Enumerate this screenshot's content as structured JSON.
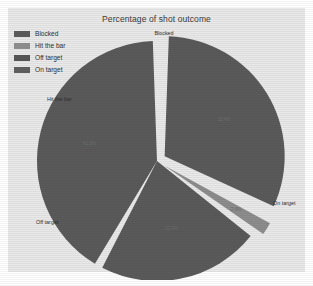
{
  "chart_data": {
    "type": "pie",
    "title": "Percentage of shot outcome",
    "categories": [
      "Blocked",
      "Hit the bar",
      "Off target",
      "On target"
    ],
    "values": [
      32.4,
      2.8,
      22.9,
      41.9
    ],
    "value_labels": [
      "32.4%",
      "2.8%",
      "22.9%",
      "41.9%"
    ],
    "unit": "%",
    "legend_position": "top-left",
    "exploded": [
      "Blocked",
      "Hit the bar"
    ],
    "colors": [
      "#5a5a5a",
      "#8d8d8d",
      "#5a5a5a",
      "#5a5a5a"
    ],
    "grid": false,
    "xlabel": "",
    "ylabel": "",
    "outer_labels": {
      "blocked": "Blocked",
      "hit_the_bar": "Hit the bar",
      "off_target": "Off target",
      "on_target": "On target"
    }
  },
  "legend": {
    "items": [
      {
        "label": "Blocked",
        "color": "#5c5c5c"
      },
      {
        "label": "Hit the bar",
        "color": "#8f8f8f"
      },
      {
        "label": "Off target",
        "color": "#555555"
      },
      {
        "label": "On target",
        "color": "#606060"
      }
    ]
  },
  "palette": {
    "page_background": "#ffffff",
    "panel_background": "#e9e9e9",
    "slice_dark": "#5a5a5a",
    "slice_light": "#8d8d8d",
    "separator": "#efefef",
    "text": "#2f2f2f"
  }
}
